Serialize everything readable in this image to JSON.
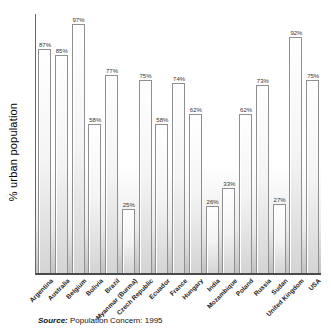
{
  "chart_data": {
    "type": "bar",
    "categories": [
      "Argentina",
      "Australia",
      "Belgium",
      "Bolivia",
      "Brazil",
      "Myanmar (Burma)",
      "Czech Republic",
      "Ecuador",
      "France",
      "Hungary",
      "India",
      "Mozambique",
      "Poland",
      "Russia",
      "Sudan",
      "United Kingdom",
      "USA"
    ],
    "values": [
      87,
      85,
      97,
      58,
      77,
      25,
      75,
      58,
      74,
      62,
      26,
      33,
      62,
      73,
      27,
      92,
      75
    ],
    "value_labels": [
      "87%",
      "85%",
      "97%",
      "58%",
      "77%",
      "25%",
      "75%",
      "58%",
      "74%",
      "62%",
      "26%",
      "33%",
      "62%",
      "73%",
      "27%",
      "92%",
      "75%"
    ],
    "title": "",
    "xlabel": "",
    "ylabel": "% urban population",
    "ylim": [
      0,
      100
    ],
    "grid": false,
    "legend_position": "none",
    "colors": {
      "bar_fill_top": "#ffffff",
      "bar_fill_bottom": "#d4d4d4",
      "bar_outline": "#8f8f8f",
      "plot_fade_bottom": "#c2c2c2",
      "axis": "#4a4a4a",
      "text": "#222222"
    }
  },
  "source": {
    "prefix": "Source:",
    "text": " Population Concern: 1995"
  }
}
